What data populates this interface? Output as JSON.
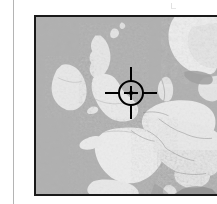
{
  "figure": {
    "kind": "shaded-relief-locator-map",
    "caption": "",
    "background_color": "#ffffff"
  },
  "margin_rule": {
    "color": "#b4b4b4",
    "orientation": "vertical"
  },
  "map": {
    "title": "",
    "region": "Western Europe",
    "projection_note": "",
    "border_color": "#1a1a1a",
    "ocean_color": "#b0b0b0",
    "land_light_color": "#f2f2f2",
    "land_mid_color": "#d6d6d6",
    "land_shadow_color": "#8a8a8a",
    "landmasses": [
      {
        "name": "Ireland"
      },
      {
        "name": "Great Britain"
      },
      {
        "name": "Scotland Highlands"
      },
      {
        "name": "France"
      },
      {
        "name": "Iberian Peninsula (north)"
      },
      {
        "name": "Low Countries"
      },
      {
        "name": "Germany"
      },
      {
        "name": "Denmark"
      },
      {
        "name": "Scandinavia"
      },
      {
        "name": "Alps"
      },
      {
        "name": "Italy (north)"
      },
      {
        "name": "Corsica"
      }
    ],
    "water_bodies": [
      {
        "name": "North Atlantic Ocean"
      },
      {
        "name": "North Sea"
      },
      {
        "name": "Baltic Sea"
      },
      {
        "name": "Mediterranean Sea"
      },
      {
        "name": "Bay of Biscay"
      }
    ]
  },
  "reticle": {
    "label": "target-location-marker",
    "color": "#000000",
    "center_x": 95,
    "center_y": 76,
    "radius": 13,
    "arm_length": 26,
    "located_over": "Northern England / Irish Sea"
  },
  "artifacts": {
    "top_speck": "scan-speck"
  }
}
